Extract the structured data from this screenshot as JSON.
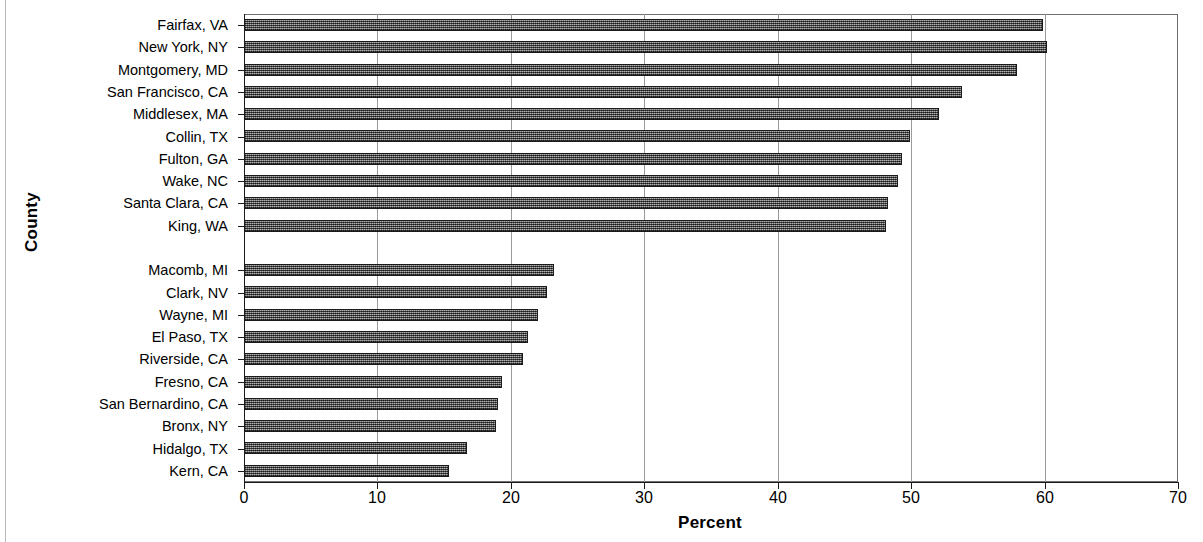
{
  "chart_data": {
    "type": "bar",
    "orientation": "horizontal",
    "title": "",
    "xlabel": "Percent",
    "ylabel": "County",
    "xlim": [
      0,
      70
    ],
    "xticks": [
      0,
      10,
      20,
      30,
      40,
      50,
      60,
      70
    ],
    "grid": true,
    "grid_axis": "x",
    "legend": "none",
    "bar_color": "#6d6d6d",
    "bar_edge_color": "#1a1a1a",
    "group_gap_after_index": 9,
    "categories": [
      "Fairfax, VA",
      "New York, NY",
      "Montgomery, MD",
      "San Francisco, CA",
      "Middlesex, MA",
      "Collin, TX",
      "Fulton, GA",
      "Wake, NC",
      "Santa Clara, CA",
      "King, WA",
      "Macomb, MI",
      "Clark, NV",
      "Wayne, MI",
      "El Paso, TX",
      "Riverside, CA",
      "Fresno, CA",
      "San Bernardino, CA",
      "Bronx, NY",
      "Hidalgo, TX",
      "Kern, CA"
    ],
    "values": [
      59.9,
      60.2,
      57.9,
      53.8,
      52.1,
      49.9,
      49.3,
      49.0,
      48.3,
      48.1,
      23.2,
      22.7,
      22.0,
      21.3,
      20.9,
      19.3,
      19.0,
      18.9,
      16.7,
      15.4
    ]
  }
}
